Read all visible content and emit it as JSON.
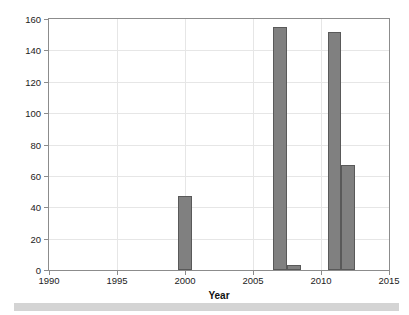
{
  "chart_data": {
    "type": "bar",
    "title": "",
    "xlabel": "Year",
    "ylabel": "Number of days with Q<0.005 cumecs",
    "xlim": [
      1990,
      2015
    ],
    "ylim": [
      0,
      160
    ],
    "xticks": [
      1990,
      1995,
      2000,
      2005,
      2010,
      2015
    ],
    "yticks": [
      0,
      20,
      40,
      60,
      80,
      100,
      120,
      140,
      160
    ],
    "xtick_labels": [
      "1990",
      "1995",
      "2000",
      "2005",
      "2010",
      "2015"
    ],
    "ytick_labels": [
      "0",
      "20",
      "40",
      "60",
      "80",
      "100",
      "120",
      "140",
      "160"
    ],
    "grid": true,
    "legend": null,
    "bar_color": "#808080",
    "bar_edge_color": "#595959",
    "categories": [
      2000,
      2007,
      2008,
      2011,
      2012
    ],
    "values": [
      47,
      155,
      3,
      152,
      67
    ],
    "bars": [
      {
        "x": 2000,
        "label": "2000",
        "value": 47
      },
      {
        "x": 2007,
        "label": "2007",
        "value": 155
      },
      {
        "x": 2008,
        "label": "2008",
        "value": 3
      },
      {
        "x": 2011,
        "label": "2011",
        "value": 152
      },
      {
        "x": 2012,
        "label": "2012",
        "value": 67
      }
    ]
  },
  "colors": {
    "background": "#ffffff",
    "axis": "#8c8c8c",
    "grid": "#e6e6e6",
    "text": "#222222",
    "bar": "#808080",
    "bar_edge": "#595959",
    "bottom_strip": "#d4d4d4"
  }
}
